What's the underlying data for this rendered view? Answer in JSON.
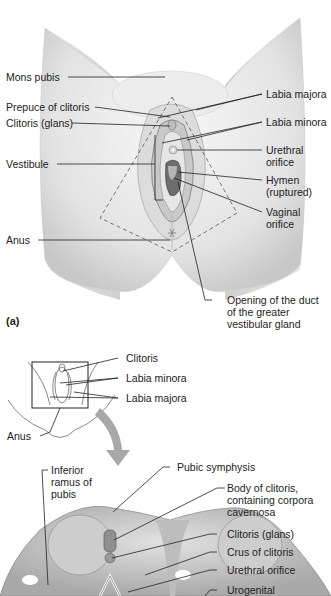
{
  "figure": {
    "panel_a": {
      "tag": "(a)",
      "labels_left": {
        "mons_pubis": "Mons pubis",
        "prepuce": "Prepuce of clitoris",
        "clitoris_glans": "Clitoris (glans)",
        "vestibule": "Vestibule",
        "anus": "Anus"
      },
      "labels_right": {
        "labia_majora": "Labia majora",
        "labia_minora": "Labia minora",
        "urethral_orifice_1": "Urethral",
        "urethral_orifice_2": "orifice",
        "hymen_1": "Hymen",
        "hymen_2": "(ruptured)",
        "vaginal_orifice_1": "Vaginal",
        "vaginal_orifice_2": "orifice",
        "duct_1": "Opening of the duct",
        "duct_2": "of the greater",
        "duct_3": "vestibular gland"
      }
    },
    "inset": {
      "labels": {
        "clitoris": "Clitoris",
        "labia_minora": "Labia minora",
        "labia_majora": "Labia majora",
        "anus": "Anus"
      }
    },
    "panel_b": {
      "labels_left": {
        "inferior_ramus_1": "Inferior",
        "inferior_ramus_2": "ramus of",
        "inferior_ramus_3": "pubis"
      },
      "labels_right": {
        "pubic_symphysis": "Pubic symphysis",
        "body_clitoris_1": "Body of clitoris,",
        "body_clitoris_2": "containing corpora",
        "body_clitoris_3": "cavernosa",
        "clitoris_glans": "Clitoris (glans)",
        "crus": "Crus of clitoris",
        "urethral_orifice": "Urethral orifice",
        "urogenital": "Urogenital"
      }
    },
    "colors": {
      "skin_light": "#f2f2f2",
      "skin_mid": "#d9d9d9",
      "skin_dark": "#9a9a9a",
      "line": "#222222",
      "arrow": "#a8a8a8"
    }
  }
}
